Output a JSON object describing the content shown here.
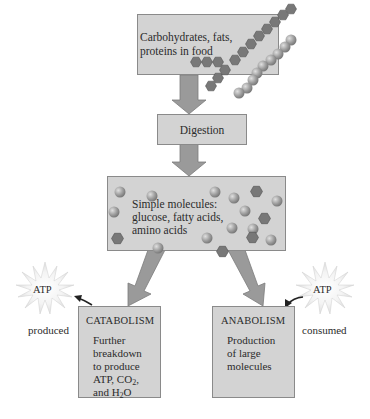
{
  "diagram": {
    "type": "metabolism-flowchart",
    "nodes": {
      "food": {
        "label": "Carbohydrates, fats, proteins in food",
        "line1": "Carbohydrates, fats,",
        "line2": "proteins in food"
      },
      "digestion": {
        "label": "Digestion"
      },
      "simple": {
        "label": "Simple molecules: glucose, fatty acids, amino acids",
        "line1": "Simple molecules:",
        "line2": "glucose, fatty acids,",
        "line3": "amino acids"
      },
      "catabolism": {
        "title": "CATABOLISM",
        "line1": "Further",
        "line2": "breakdown",
        "line3": "to produce",
        "line4_prefix": "ATP, CO",
        "line4_sub": "2",
        "line4_suffix": ",",
        "line5_prefix": "and H",
        "line5_sub": "2",
        "line5_suffix": "O"
      },
      "anabolism": {
        "title": "ANABOLISM",
        "line1": "Production",
        "line2": "of large",
        "line3": "molecules"
      },
      "atp_left": {
        "label": "ATP",
        "caption": "produced"
      },
      "atp_right": {
        "label": "ATP",
        "caption": "consumed"
      }
    },
    "edges": [
      {
        "from": "food",
        "to": "digestion"
      },
      {
        "from": "digestion",
        "to": "simple"
      },
      {
        "from": "simple",
        "to": "catabolism"
      },
      {
        "from": "simple",
        "to": "anabolism"
      },
      {
        "from": "catabolism",
        "to": "atp_left",
        "label": "produced"
      },
      {
        "from": "atp_right",
        "to": "anabolism",
        "label": "consumed"
      }
    ],
    "colors": {
      "box_fill": "#d3d3d3",
      "box_border": "#8a8a8a",
      "arrow_fill": "#9a9a9a",
      "hexagon_fill": "#7a7a7a",
      "sphere_fill": "#a8a8a8",
      "star_fill": "#ececec"
    }
  }
}
